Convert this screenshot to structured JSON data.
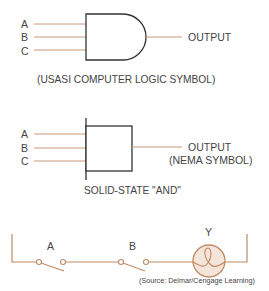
{
  "usasi_gate": {
    "inputs": [
      "A",
      "B",
      "C"
    ],
    "output_label": "OUTPUT",
    "caption": "(USASI COMPUTER LOGIC SYMBOL)"
  },
  "nema_gate": {
    "inputs": [
      "A",
      "B",
      "C"
    ],
    "output_label": "OUTPUT",
    "output_sublabel": "(NEMA SYMBOL)",
    "caption": "SOLID-STATE \"AND\""
  },
  "circuit": {
    "switches": [
      "A",
      "B"
    ],
    "lamp_label": "Y",
    "source": "(Source: Delmar/Cengage Learning)"
  },
  "colors": {
    "wire": "#c89a78",
    "gate_outline": "#333333",
    "lamp_fill": "#f5e4da",
    "lamp_stroke": "#c08a64"
  }
}
